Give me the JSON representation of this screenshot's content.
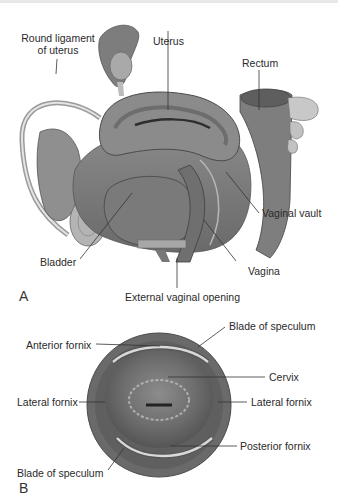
{
  "figure": {
    "panel_a": {
      "letter": "A",
      "labels": {
        "round_ligament_line1": "Round ligament",
        "round_ligament_line2": "of uterus",
        "uterus": "Uterus",
        "rectum": "Rectum",
        "vaginal_vault": "Vaginal vault",
        "bladder": "Bladder",
        "vagina": "Vagina",
        "external_opening": "External vaginal opening"
      }
    },
    "panel_b": {
      "letter": "B",
      "labels": {
        "blade_top": "Blade of speculum",
        "anterior_fornix": "Anterior fornix",
        "cervix": "Cervix",
        "lateral_fornix_left": "Lateral fornix",
        "lateral_fornix_right": "Lateral fornix",
        "posterior_fornix": "Posterior fornix",
        "blade_bottom": "Blade of speculum"
      }
    }
  }
}
